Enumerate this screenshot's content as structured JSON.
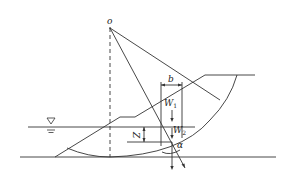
{
  "diagram": {
    "type": "slope-stability-slip-circle",
    "labels": {
      "center": "o",
      "slice_width": "b",
      "weight_above_water": "W",
      "weight_above_water_sub": "1",
      "weight_below_water": "W",
      "weight_below_water_sub": "2",
      "water_depth": "Z",
      "angle": "α"
    },
    "symbols": {
      "water_level": "water-table-triangle"
    },
    "colors": {
      "line": "#333333",
      "background": "#ffffff"
    }
  }
}
